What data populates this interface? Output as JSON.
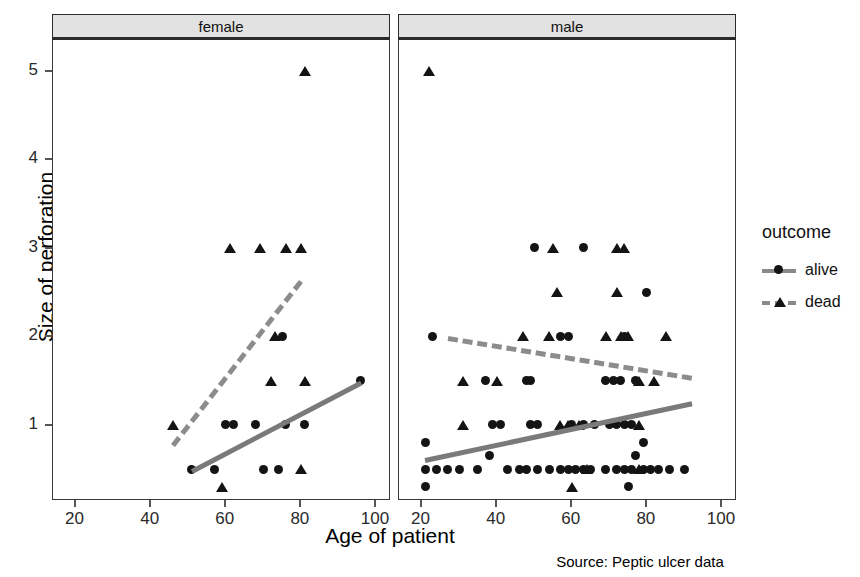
{
  "caption": "Source: Peptic ulcer data",
  "axes": {
    "xlabel": "Age of patient",
    "ylabel": "Size of perforation",
    "xticks": [
      20,
      40,
      60,
      80,
      100
    ],
    "yticks": [
      1,
      2,
      3,
      4,
      5
    ],
    "xlim": [
      14,
      104
    ],
    "ylim": [
      0.15,
      5.35
    ]
  },
  "panels": [
    {
      "label": "female"
    },
    {
      "label": "male"
    }
  ],
  "legend": {
    "title": "outcome",
    "items": [
      {
        "label": "alive",
        "marker": "circle-marker",
        "line": "solid",
        "color": "#8a8a8a"
      },
      {
        "label": "dead",
        "marker": "triangle-marker",
        "line": "dashed",
        "color": "#8a8a8a"
      }
    ]
  },
  "colors": {
    "marker": "#141414",
    "trend_solid": "#7a7a7a",
    "trend_dashed": "#8c8c8c",
    "strip_fill": "#e2e2e2",
    "panel_border": "#3a3a3a"
  },
  "chart_data": {
    "type": "scatter",
    "title": "",
    "xlabel": "Age of patient",
    "ylabel": "Size of perforation",
    "xlim": [
      14,
      104
    ],
    "ylim": [
      0.15,
      5.35
    ],
    "xticks": [
      20,
      40,
      60,
      80,
      100
    ],
    "yticks": [
      1,
      2,
      3,
      4,
      5
    ],
    "grid": false,
    "legend_position": "right",
    "facet_variable": "sex",
    "group_variable": "outcome",
    "facets": [
      {
        "name": "female",
        "series": [
          {
            "name": "alive",
            "marker": "circle",
            "points": [
              [
                51,
                0.5
              ],
              [
                57,
                0.5
              ],
              [
                70,
                0.5
              ],
              [
                74,
                0.5
              ],
              [
                60,
                1.0
              ],
              [
                62,
                1.0
              ],
              [
                68,
                1.0
              ],
              [
                76,
                1.0
              ],
              [
                81,
                1.0
              ],
              [
                75,
                2.0
              ],
              [
                96,
                1.5
              ]
            ],
            "trend": {
              "type": "linear",
              "x": [
                51,
                96
              ],
              "y": [
                0.5,
                1.5
              ],
              "style": "solid"
            }
          },
          {
            "name": "dead",
            "marker": "triangle",
            "points": [
              [
                46,
                1.0
              ],
              [
                59,
                0.3
              ],
              [
                80,
                0.5
              ],
              [
                61,
                3.0
              ],
              [
                69,
                3.0
              ],
              [
                76,
                3.0
              ],
              [
                80,
                3.0
              ],
              [
                72,
                1.5
              ],
              [
                81,
                1.5
              ],
              [
                73,
                2.0
              ],
              [
                81,
                5.0
              ]
            ],
            "trend": {
              "type": "linear",
              "x": [
                46,
                80
              ],
              "y": [
                0.8,
                2.65
              ],
              "style": "dashed"
            }
          }
        ]
      },
      {
        "name": "male",
        "series": [
          {
            "name": "alive",
            "marker": "circle",
            "points": [
              [
                21,
                0.5
              ],
              [
                24,
                0.5
              ],
              [
                27,
                0.5
              ],
              [
                30,
                0.5
              ],
              [
                35,
                0.5
              ],
              [
                43,
                0.5
              ],
              [
                46,
                0.5
              ],
              [
                48,
                0.5
              ],
              [
                51,
                0.5
              ],
              [
                54,
                0.5
              ],
              [
                57,
                0.5
              ],
              [
                59,
                0.5
              ],
              [
                61,
                0.5
              ],
              [
                63,
                0.5
              ],
              [
                65,
                0.5
              ],
              [
                69,
                0.5
              ],
              [
                72,
                0.5
              ],
              [
                74,
                0.5
              ],
              [
                76,
                0.5
              ],
              [
                79,
                0.5
              ],
              [
                81,
                0.5
              ],
              [
                83,
                0.5
              ],
              [
                86,
                0.5
              ],
              [
                90,
                0.5
              ],
              [
                21,
                0.3
              ],
              [
                75,
                0.3
              ],
              [
                21,
                0.8
              ],
              [
                38,
                0.65
              ],
              [
                77,
                0.65
              ],
              [
                79,
                0.8
              ],
              [
                39,
                1.0
              ],
              [
                41,
                1.0
              ],
              [
                49,
                1.0
              ],
              [
                51,
                1.0
              ],
              [
                60,
                1.0
              ],
              [
                63,
                1.0
              ],
              [
                66,
                1.0
              ],
              [
                70,
                1.0
              ],
              [
                72,
                1.0
              ],
              [
                74,
                1.0
              ],
              [
                76,
                1.0
              ],
              [
                37,
                1.5
              ],
              [
                48,
                1.5
              ],
              [
                49,
                1.5
              ],
              [
                69,
                1.5
              ],
              [
                71,
                1.5
              ],
              [
                73,
                1.5
              ],
              [
                77,
                1.5
              ],
              [
                23,
                2.0
              ],
              [
                57,
                2.0
              ],
              [
                59,
                2.0
              ],
              [
                74,
                2.0
              ],
              [
                80,
                2.5
              ],
              [
                50,
                3.0
              ],
              [
                63,
                3.0
              ]
            ],
            "trend": {
              "type": "linear",
              "x": [
                21,
                92
              ],
              "y": [
                0.62,
                1.26
              ],
              "style": "solid"
            }
          },
          {
            "name": "dead",
            "marker": "triangle",
            "points": [
              [
                22,
                5.0
              ],
              [
                55,
                3.0
              ],
              [
                72,
                3.0
              ],
              [
                74,
                3.0
              ],
              [
                56,
                2.5
              ],
              [
                72,
                2.5
              ],
              [
                47,
                2.0
              ],
              [
                54,
                2.0
              ],
              [
                69,
                2.0
              ],
              [
                73,
                2.0
              ],
              [
                75,
                2.0
              ],
              [
                85,
                2.0
              ],
              [
                31,
                1.5
              ],
              [
                40,
                1.5
              ],
              [
                78,
                1.5
              ],
              [
                82,
                1.5
              ],
              [
                31,
                1.0
              ],
              [
                57,
                1.0
              ],
              [
                59,
                1.0
              ],
              [
                62,
                1.0
              ],
              [
                78,
                1.0
              ],
              [
                64,
                0.5
              ],
              [
                78,
                0.5
              ],
              [
                60,
                0.3
              ]
            ],
            "trend": {
              "type": "linear",
              "x": [
                27,
                92
              ],
              "y": [
                2.0,
                1.55
              ],
              "style": "dashed"
            }
          }
        ]
      }
    ]
  }
}
